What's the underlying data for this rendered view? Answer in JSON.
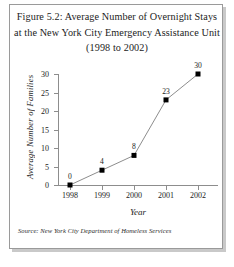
{
  "figure": {
    "title_lines": [
      "Figure 5.2: Average Number of Overnight Stays",
      "at the New York City Emergency Assistance Unit",
      "(1998 to 2002)"
    ],
    "source_note": "Source: New York City Department of Homeless Services",
    "border_color": "#9a9a9a",
    "shadow_color": "#c9c9c9"
  },
  "chart_data": {
    "type": "line",
    "title": "Figure 5.2: Average Number of Overnight Stays at the New York City Emergency Assistance Unit (1998 to 2002)",
    "xlabel": "Year",
    "ylabel": "Average Number of Families",
    "categories": [
      "1998",
      "1999",
      "2000",
      "2001",
      "2002"
    ],
    "x": [
      1998,
      1999,
      2000,
      2001,
      2002
    ],
    "values": [
      0,
      4,
      8,
      23,
      30
    ],
    "point_labels": [
      "0",
      "4",
      "8",
      "23",
      "30"
    ],
    "ylim": [
      0,
      30
    ],
    "yticks": [
      0,
      5,
      10,
      15,
      20,
      25,
      30
    ],
    "ytick_labels": [
      "0",
      "5",
      "10",
      "15",
      "20",
      "25",
      "30"
    ],
    "xtick_labels": [
      "1998",
      "1999",
      "2000",
      "2001",
      "2002"
    ],
    "grid": false,
    "legend": false,
    "marker": "square",
    "marker_color": "#000000",
    "line_color": "#8d8d8d",
    "axis_color": "#8d8d8d"
  }
}
